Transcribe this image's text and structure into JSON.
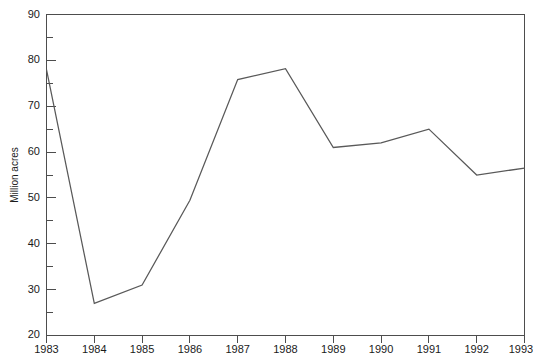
{
  "chart_data": {
    "type": "line",
    "title": "",
    "subtitle": "",
    "xlabel": "",
    "ylabel": "Million acres",
    "categories": [
      "1983",
      "1984",
      "1985",
      "1986",
      "1987",
      "1988",
      "1989",
      "1990",
      "1991",
      "1992",
      "1993"
    ],
    "x": [
      1983,
      1984,
      1985,
      1986,
      1987,
      1988,
      1989,
      1990,
      1991,
      1992,
      1993
    ],
    "values": [
      78,
      27,
      31,
      49.5,
      75.8,
      78.2,
      61,
      62,
      65,
      55,
      56.5
    ],
    "series": [
      {
        "name": "Million acres",
        "values": [
          78,
          27,
          31,
          49.5,
          75.8,
          78.2,
          61,
          62,
          65,
          55,
          56.5
        ],
        "color": "#595959"
      }
    ],
    "xlim": [
      1983,
      1993
    ],
    "ylim": [
      20,
      90
    ],
    "y_major_ticks": [
      20,
      30,
      40,
      50,
      60,
      70,
      80,
      90
    ],
    "y_minor_ticks": [
      25,
      35,
      45,
      55,
      65,
      75,
      85
    ],
    "y_tick_labels": [
      "20",
      "30",
      "40",
      "50",
      "60",
      "70",
      "80",
      "90"
    ],
    "x_tick_labels": [
      "1983",
      "1984",
      "1985",
      "1986",
      "1987",
      "1988",
      "1989",
      "1990",
      "1991",
      "1992",
      "1993"
    ],
    "grid": false,
    "legend": false,
    "legend_position": "none",
    "annotations": [],
    "line_color": "#595959",
    "axis_color": "#4d4d4d",
    "background_color": "#ffffff"
  },
  "axes": {
    "y_axis_label": "Million acres",
    "y_ticks": [
      "90",
      "80",
      "70",
      "60",
      "50",
      "40",
      "30",
      "20"
    ],
    "x_ticks": [
      "1983",
      "1984",
      "1985",
      "1986",
      "1987",
      "1988",
      "1989",
      "1990",
      "1991",
      "1992",
      "1993"
    ]
  }
}
